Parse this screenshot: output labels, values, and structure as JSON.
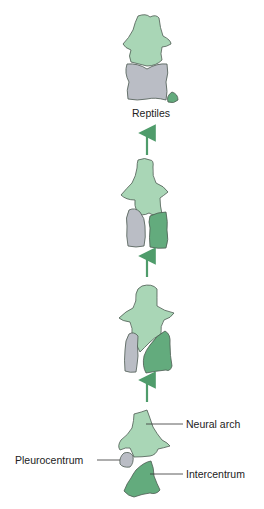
{
  "diagram": {
    "stages": [
      {
        "id": "reptiles",
        "label": "Reptiles"
      },
      {
        "id": "stage3"
      },
      {
        "id": "stage2"
      },
      {
        "id": "stage1-labeled"
      }
    ],
    "labels": {
      "neural_arch": "Neural arch",
      "pleurocentrum": "Pleurocentrum",
      "intercentrum": "Intercentrum",
      "reptiles": "Reptiles"
    },
    "colors": {
      "neural_arch": "#a9d6b6",
      "pleurocentrum": "#babdc5",
      "intercentrum": "#63ab7d",
      "outline": "#4d5a52",
      "arrow": "#4f9c6b"
    }
  }
}
